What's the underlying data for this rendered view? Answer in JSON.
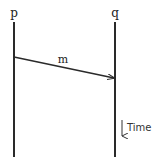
{
  "diagram": {
    "type": "space-time diagram",
    "processes": [
      {
        "id": "p",
        "label": "p",
        "x": 14,
        "y_top": 22,
        "y_bottom": 157
      },
      {
        "id": "q",
        "label": "q",
        "x": 115,
        "y_top": 22,
        "y_bottom": 157
      }
    ],
    "messages": [
      {
        "label": "m",
        "from": "p",
        "to": "q",
        "from_y": 57,
        "to_y": 78
      }
    ],
    "time_axis": {
      "label": "Time",
      "direction": "down"
    },
    "colors": {
      "line": "#2a2a2a",
      "text": "#222222",
      "background": "#ffffff"
    }
  }
}
